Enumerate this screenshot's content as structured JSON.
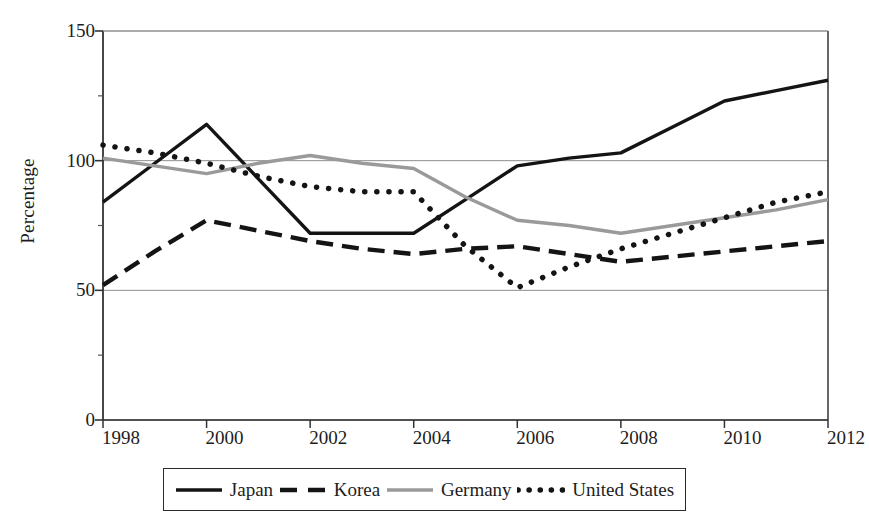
{
  "chart_data": {
    "type": "line",
    "title": "",
    "subtitle": "",
    "xlabel": "",
    "ylabel": "Percentage",
    "x": [
      1998,
      1999,
      2000,
      2001,
      2002,
      2003,
      2004,
      2005,
      2006,
      2007,
      2008,
      2009,
      2010,
      2011,
      2012
    ],
    "categories": [
      "1998",
      "1999",
      "2000",
      "2001",
      "2002",
      "2003",
      "2004",
      "2005",
      "2006",
      "2007",
      "2008",
      "2009",
      "2010",
      "2011",
      "2012"
    ],
    "tick_labels_x": [
      "1998",
      "2000",
      "2002",
      "2004",
      "2006",
      "2008",
      "2010",
      "2012"
    ],
    "tick_labels_y": [
      "0",
      "50",
      "100",
      "150"
    ],
    "ylim": [
      0,
      150
    ],
    "yticks": [
      0,
      50,
      100,
      150
    ],
    "xlim": [
      1998,
      2012
    ],
    "grid": "horizontal",
    "legend_position": "below-axes",
    "series": [
      {
        "name": "Japan",
        "style": "solid",
        "color": "#141414",
        "values": [
          84,
          99,
          114,
          93,
          72,
          72,
          72,
          85,
          98,
          101,
          103,
          113,
          123,
          127,
          131
        ]
      },
      {
        "name": "Korea",
        "style": "dashed",
        "color": "#141414",
        "values": [
          52,
          65,
          77,
          73,
          69,
          66,
          64,
          66,
          67,
          64,
          61,
          63,
          65,
          67,
          69
        ]
      },
      {
        "name": "Germany",
        "style": "solid",
        "color": "#9a9a9a",
        "values": [
          101,
          98,
          95,
          99,
          102,
          99,
          97,
          86,
          77,
          75,
          72,
          75,
          78,
          81,
          85
        ]
      },
      {
        "name": "United States",
        "style": "dotted",
        "color": "#141414",
        "values": [
          106,
          103,
          99,
          94,
          90,
          88,
          88,
          67,
          51,
          59,
          66,
          72,
          78,
          84,
          88
        ]
      }
    ]
  },
  "axis": {
    "y_title": "Percentage"
  },
  "legend": {
    "entries": [
      {
        "label": "Japan",
        "style": "solid",
        "color": "#141414"
      },
      {
        "label": "Korea",
        "style": "dashed",
        "color": "#141414"
      },
      {
        "label": "Germany",
        "style": "solid",
        "color": "#9a9a9a"
      },
      {
        "label": "United States",
        "style": "dotted",
        "color": "#141414"
      }
    ]
  }
}
